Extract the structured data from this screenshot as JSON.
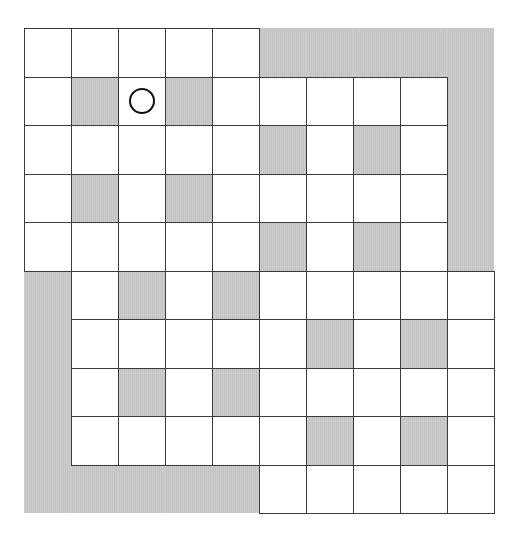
{
  "board": {
    "rows": 10,
    "cols": 10,
    "legend": {
      "W": "white-cell",
      "G": "shaded-cell",
      "B": "shaded-border-region"
    },
    "grid": [
      [
        "W",
        "W",
        "W",
        "W",
        "W",
        "B",
        "B",
        "B",
        "B",
        "B"
      ],
      [
        "W",
        "G",
        "W",
        "G",
        "W",
        "W",
        "W",
        "W",
        "W",
        "B"
      ],
      [
        "W",
        "W",
        "W",
        "W",
        "W",
        "G",
        "W",
        "G",
        "W",
        "B"
      ],
      [
        "W",
        "G",
        "W",
        "G",
        "W",
        "W",
        "W",
        "W",
        "W",
        "B"
      ],
      [
        "W",
        "W",
        "W",
        "W",
        "W",
        "G",
        "W",
        "G",
        "W",
        "B"
      ],
      [
        "B",
        "W",
        "G",
        "W",
        "G",
        "W",
        "W",
        "W",
        "W",
        "W"
      ],
      [
        "B",
        "W",
        "W",
        "W",
        "W",
        "W",
        "G",
        "W",
        "G",
        "W"
      ],
      [
        "B",
        "W",
        "G",
        "W",
        "G",
        "W",
        "W",
        "W",
        "W",
        "W"
      ],
      [
        "B",
        "W",
        "W",
        "W",
        "W",
        "W",
        "G",
        "W",
        "G",
        "W"
      ],
      [
        "B",
        "B",
        "B",
        "B",
        "B",
        "W",
        "W",
        "W",
        "W",
        "W"
      ]
    ],
    "markers": [
      {
        "type": "circle",
        "row": 1,
        "col": 2
      }
    ],
    "colors": {
      "shade": "#c9c9c9",
      "line": "#3a3a3a",
      "marker": "#111111"
    }
  }
}
